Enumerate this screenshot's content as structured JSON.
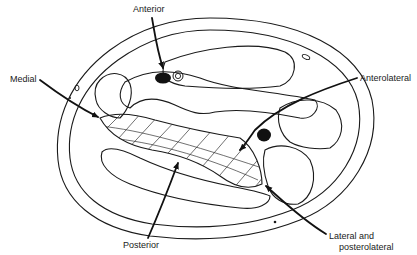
{
  "figure": {
    "type": "anatomical cross-section diagram",
    "colors": {
      "stroke": "#1a1a1a",
      "fill_dark": "#111111",
      "background": "#ffffff"
    },
    "labels": {
      "anterior": "Anterior",
      "medial": "Medial",
      "anterolateral": "Anterolateral",
      "posterior": "Posterior",
      "lateral_line1": "Lateral and",
      "lateral_line2": "posterolateral"
    },
    "arrows": [
      {
        "name": "anterior",
        "from": "label top",
        "to": "near dark vessel"
      },
      {
        "name": "medial",
        "from": "left label",
        "to": "left tip of hatched region"
      },
      {
        "name": "anterolateral",
        "from": "right label",
        "to": "right portion of hatched region"
      },
      {
        "name": "posterior",
        "from": "bottom label",
        "to": "lower edge of hatched region"
      },
      {
        "name": "lateral-and-posterolateral",
        "from": "bottom-right label",
        "to": "right tip of hatched region"
      }
    ]
  }
}
